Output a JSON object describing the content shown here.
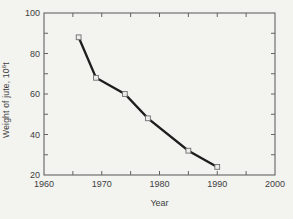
{
  "figure": {
    "background": "#f3f3f0",
    "axis_color": "#636363",
    "text_color": "#3e3e3e",
    "line_color": "#1e1e1e",
    "marker_fill": "#ededea",
    "marker_edge": "#6e6e6e"
  },
  "chart_data": {
    "type": "line",
    "title": "",
    "xlabel": "Year",
    "ylabel": "Weight of jute, 10^6 t",
    "ylabel_parts": {
      "main": "Weight of jute, 10",
      "superscript": "6",
      "suffix": "t"
    },
    "x": [
      1966,
      1969,
      1974,
      1978,
      1985,
      1990
    ],
    "y": [
      88,
      68,
      60,
      48,
      32,
      24
    ],
    "xlim": [
      1960,
      2000
    ],
    "ylim": [
      20,
      100
    ],
    "x_major_ticks": [
      1960,
      1970,
      1980,
      1990,
      2000
    ],
    "x_tick_labels": [
      "1960",
      "1970",
      "1980",
      "1990",
      "2000"
    ],
    "x_minor_ticks": [
      1965,
      1975,
      1985,
      1995
    ],
    "y_major_ticks": [
      20,
      40,
      60,
      80,
      100
    ],
    "y_tick_labels": [
      "20",
      "40",
      "60",
      "80",
      "100"
    ],
    "y_minor_ticks": [
      30,
      50,
      70,
      90
    ],
    "marker": "open-square",
    "grid": false,
    "legend_position": "none"
  }
}
